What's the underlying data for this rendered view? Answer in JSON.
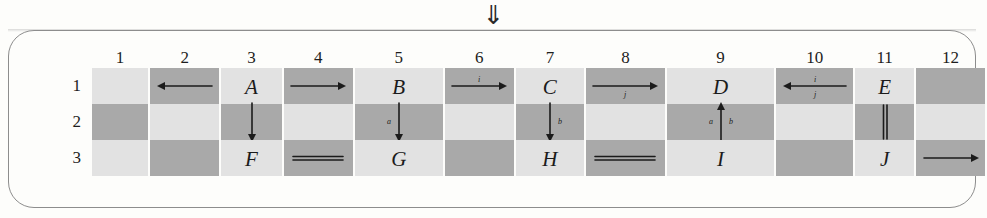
{
  "figure": {
    "top_symbol": "⇓",
    "top_symbol_name": "double-down-arrow"
  },
  "grid": {
    "column_headers": [
      "1",
      "2",
      "3",
      "4",
      "5",
      "6",
      "7",
      "8",
      "9",
      "10",
      "11",
      "12"
    ],
    "row_headers": [
      "1",
      "2",
      "3"
    ],
    "column_widths": [
      58,
      70,
      62,
      70,
      90,
      70,
      70,
      80,
      110,
      78,
      60,
      70
    ],
    "shading": {
      "light": "#e2e2e2",
      "dark": "#a9a9a9",
      "pattern_note": "checkerboard: odd columns light-dark-light, even columns dark-light-dark"
    },
    "cells": [
      {
        "col": 1,
        "row": 1,
        "shade": "light",
        "content_type": "empty",
        "text": ""
      },
      {
        "col": 1,
        "row": 2,
        "shade": "dark",
        "content_type": "empty",
        "text": ""
      },
      {
        "col": 1,
        "row": 3,
        "shade": "light",
        "content_type": "empty",
        "text": ""
      },
      {
        "col": 2,
        "row": 1,
        "shade": "dark",
        "content_type": "arrow-left",
        "text": "",
        "label_above": "",
        "label_below": ""
      },
      {
        "col": 2,
        "row": 2,
        "shade": "light",
        "content_type": "empty",
        "text": ""
      },
      {
        "col": 2,
        "row": 3,
        "shade": "dark",
        "content_type": "empty",
        "text": ""
      },
      {
        "col": 3,
        "row": 1,
        "shade": "light",
        "content_type": "letter",
        "text": "A"
      },
      {
        "col": 3,
        "row": 2,
        "shade": "dark",
        "content_type": "arrow-down",
        "text": "",
        "label_left": "",
        "label_right": ""
      },
      {
        "col": 3,
        "row": 3,
        "shade": "light",
        "content_type": "letter",
        "text": "F"
      },
      {
        "col": 4,
        "row": 1,
        "shade": "dark",
        "content_type": "arrow-right",
        "text": "",
        "label_above": "",
        "label_below": ""
      },
      {
        "col": 4,
        "row": 2,
        "shade": "light",
        "content_type": "empty",
        "text": ""
      },
      {
        "col": 4,
        "row": 3,
        "shade": "dark",
        "content_type": "double-line-horizontal",
        "text": ""
      },
      {
        "col": 5,
        "row": 1,
        "shade": "light",
        "content_type": "letter",
        "text": "B"
      },
      {
        "col": 5,
        "row": 2,
        "shade": "dark",
        "content_type": "arrow-down",
        "text": "",
        "label_left": "a",
        "label_right": ""
      },
      {
        "col": 5,
        "row": 3,
        "shade": "light",
        "content_type": "letter",
        "text": "G"
      },
      {
        "col": 6,
        "row": 1,
        "shade": "dark",
        "content_type": "arrow-right",
        "text": "",
        "label_above": "i",
        "label_below": ""
      },
      {
        "col": 6,
        "row": 2,
        "shade": "light",
        "content_type": "empty",
        "text": ""
      },
      {
        "col": 6,
        "row": 3,
        "shade": "dark",
        "content_type": "empty",
        "text": ""
      },
      {
        "col": 7,
        "row": 1,
        "shade": "light",
        "content_type": "letter",
        "text": "C"
      },
      {
        "col": 7,
        "row": 2,
        "shade": "dark",
        "content_type": "arrow-down",
        "text": "",
        "label_left": "",
        "label_right": "b"
      },
      {
        "col": 7,
        "row": 3,
        "shade": "light",
        "content_type": "letter",
        "text": "H"
      },
      {
        "col": 8,
        "row": 1,
        "shade": "dark",
        "content_type": "arrow-right",
        "text": "",
        "label_above": "",
        "label_below": "j"
      },
      {
        "col": 8,
        "row": 2,
        "shade": "light",
        "content_type": "empty",
        "text": ""
      },
      {
        "col": 8,
        "row": 3,
        "shade": "dark",
        "content_type": "double-line-horizontal",
        "text": ""
      },
      {
        "col": 9,
        "row": 1,
        "shade": "light",
        "content_type": "letter",
        "text": "D"
      },
      {
        "col": 9,
        "row": 2,
        "shade": "dark",
        "content_type": "arrow-up",
        "text": "",
        "label_left": "a",
        "label_right": "b"
      },
      {
        "col": 9,
        "row": 3,
        "shade": "light",
        "content_type": "letter",
        "text": "I"
      },
      {
        "col": 10,
        "row": 1,
        "shade": "dark",
        "content_type": "arrow-left",
        "text": "",
        "label_above": "i",
        "label_below": "j"
      },
      {
        "col": 10,
        "row": 2,
        "shade": "light",
        "content_type": "empty",
        "text": ""
      },
      {
        "col": 10,
        "row": 3,
        "shade": "dark",
        "content_type": "empty",
        "text": ""
      },
      {
        "col": 11,
        "row": 1,
        "shade": "light",
        "content_type": "letter",
        "text": "E"
      },
      {
        "col": 11,
        "row": 2,
        "shade": "dark",
        "content_type": "double-line-vertical",
        "text": ""
      },
      {
        "col": 11,
        "row": 3,
        "shade": "light",
        "content_type": "letter",
        "text": "J"
      },
      {
        "col": 12,
        "row": 1,
        "shade": "dark",
        "content_type": "empty",
        "text": ""
      },
      {
        "col": 12,
        "row": 2,
        "shade": "light",
        "content_type": "empty",
        "text": ""
      },
      {
        "col": 12,
        "row": 3,
        "shade": "dark",
        "content_type": "arrow-right",
        "text": "",
        "label_above": "",
        "label_below": ""
      }
    ]
  }
}
